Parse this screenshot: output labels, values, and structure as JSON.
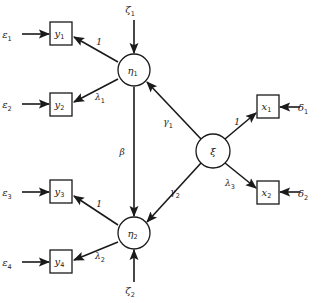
{
  "diagram": {
    "type": "structural-equation-model-path-diagram",
    "colors": {
      "ink": "#1a1a1a",
      "background": "#ffffff"
    },
    "latent_nodes": [
      {
        "id": "eta1",
        "symbol": "η",
        "sub": "1",
        "cx": 134,
        "cy": 70,
        "r": 16
      },
      {
        "id": "eta2",
        "symbol": "η",
        "sub": "2",
        "cx": 134,
        "cy": 233,
        "r": 16
      },
      {
        "id": "xi",
        "symbol": "ξ",
        "sub": "",
        "cx": 213,
        "cy": 151,
        "r": 17
      }
    ],
    "observed_nodes": [
      {
        "id": "y1",
        "symbol": "y",
        "sub": "1",
        "x": 50,
        "y": 22,
        "w": 22,
        "h": 23
      },
      {
        "id": "y2",
        "symbol": "y",
        "sub": "2",
        "x": 50,
        "y": 93,
        "w": 22,
        "h": 23
      },
      {
        "id": "y3",
        "symbol": "y",
        "sub": "3",
        "x": 50,
        "y": 180,
        "w": 22,
        "h": 23
      },
      {
        "id": "y4",
        "symbol": "y",
        "sub": "4",
        "x": 50,
        "y": 250,
        "w": 22,
        "h": 23
      },
      {
        "id": "x1",
        "symbol": "x",
        "sub": "1",
        "x": 257,
        "y": 95,
        "w": 22,
        "h": 23
      },
      {
        "id": "x2",
        "symbol": "x",
        "sub": "2",
        "x": 257,
        "y": 181,
        "w": 22,
        "h": 23
      }
    ],
    "error_terms": [
      {
        "id": "eps1",
        "symbol": "ε",
        "sub": "1",
        "x": 7,
        "y": 38,
        "target": "y1"
      },
      {
        "id": "eps2",
        "symbol": "ε",
        "sub": "2",
        "x": 7,
        "y": 108,
        "target": "y2"
      },
      {
        "id": "eps3",
        "symbol": "ε",
        "sub": "3",
        "x": 7,
        "y": 196,
        "target": "y3"
      },
      {
        "id": "eps4",
        "symbol": "ε",
        "sub": "4",
        "x": 7,
        "y": 266,
        "target": "y4"
      },
      {
        "id": "delta1",
        "symbol": "δ",
        "sub": "1",
        "x": 303,
        "y": 111,
        "target": "x1"
      },
      {
        "id": "delta2",
        "symbol": "δ",
        "sub": "2",
        "x": 303,
        "y": 197,
        "target": "x2"
      },
      {
        "id": "zeta1",
        "symbol": "ζ",
        "sub": "1",
        "x": 130,
        "y": 13,
        "target": "eta1"
      },
      {
        "id": "zeta2",
        "symbol": "ζ",
        "sub": "2",
        "x": 130,
        "y": 294,
        "target": "eta2"
      }
    ],
    "edges": [
      {
        "id": "eps1-y1",
        "x1": 22,
        "y1": 34,
        "x2": 49,
        "y2": 34,
        "label": "",
        "sub": ""
      },
      {
        "id": "eps2-y2",
        "x1": 22,
        "y1": 104,
        "x2": 49,
        "y2": 104,
        "label": "",
        "sub": ""
      },
      {
        "id": "eps3-y3",
        "x1": 22,
        "y1": 192,
        "x2": 49,
        "y2": 192,
        "label": "",
        "sub": ""
      },
      {
        "id": "eps4-y4",
        "x1": 22,
        "y1": 262,
        "x2": 49,
        "y2": 262,
        "label": "",
        "sub": ""
      },
      {
        "id": "delta1-x1",
        "x1": 300,
        "y1": 107,
        "x2": 280,
        "y2": 107,
        "label": "",
        "sub": ""
      },
      {
        "id": "delta2-x2",
        "x1": 300,
        "y1": 192,
        "x2": 280,
        "y2": 192,
        "label": "",
        "sub": ""
      },
      {
        "id": "zeta1-eta1",
        "x1": 134,
        "y1": 20,
        "x2": 134,
        "y2": 53,
        "label": "",
        "sub": ""
      },
      {
        "id": "zeta2-eta2",
        "x1": 134,
        "y1": 282,
        "x2": 134,
        "y2": 250,
        "label": "",
        "sub": ""
      },
      {
        "id": "eta1-y1",
        "x1": 118,
        "y1": 62,
        "x2": 74,
        "y2": 37,
        "label": "1",
        "sub": "",
        "lx": 99,
        "ly": 45
      },
      {
        "id": "eta1-y2",
        "x1": 118,
        "y1": 79,
        "x2": 74,
        "y2": 102,
        "label": "λ",
        "sub": "1",
        "lx": 100,
        "ly": 100
      },
      {
        "id": "eta2-y3",
        "x1": 118,
        "y1": 225,
        "x2": 74,
        "y2": 196,
        "label": "1",
        "sub": "",
        "lx": 99,
        "ly": 207
      },
      {
        "id": "eta2-y4",
        "x1": 118,
        "y1": 242,
        "x2": 74,
        "y2": 260,
        "label": "λ",
        "sub": "2",
        "lx": 100,
        "ly": 259
      },
      {
        "id": "eta1-eta2",
        "x1": 134,
        "y1": 87,
        "x2": 134,
        "y2": 216,
        "label": "β",
        "sub": "",
        "lx": 122,
        "ly": 155
      },
      {
        "id": "xi-eta1",
        "x1": 201,
        "y1": 139,
        "x2": 147,
        "y2": 82,
        "label": "γ",
        "sub": "1",
        "lx": 168,
        "ly": 125
      },
      {
        "id": "xi-eta2",
        "x1": 201,
        "y1": 163,
        "x2": 147,
        "y2": 222,
        "label": "γ",
        "sub": "2",
        "lx": 175,
        "ly": 195
      },
      {
        "id": "xi-x1",
        "x1": 225,
        "y1": 139,
        "x2": 256,
        "y2": 113,
        "label": "1",
        "sub": "",
        "lx": 237,
        "ly": 125
      },
      {
        "id": "xi-x2",
        "x1": 225,
        "y1": 163,
        "x2": 256,
        "y2": 188,
        "label": "λ",
        "sub": "3",
        "lx": 230,
        "ly": 186
      }
    ]
  }
}
